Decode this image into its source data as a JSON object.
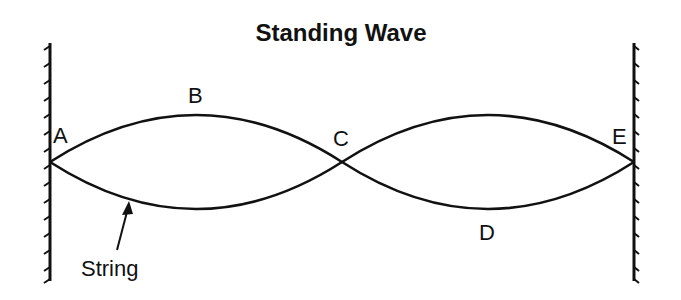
{
  "diagram": {
    "title": "Standing Wave",
    "points": [
      {
        "id": "A",
        "label": "A",
        "role": "node at left wall"
      },
      {
        "id": "B",
        "label": "B",
        "role": "antinode (crest)"
      },
      {
        "id": "C",
        "label": "C",
        "role": "node (center crossing)"
      },
      {
        "id": "D",
        "label": "D",
        "role": "antinode (trough)"
      },
      {
        "id": "E",
        "label": "E",
        "role": "node at right wall"
      }
    ],
    "annotation": {
      "label": "String",
      "points_to": "lower string curve"
    },
    "walls": [
      "left fixed wall",
      "right fixed wall"
    ]
  }
}
